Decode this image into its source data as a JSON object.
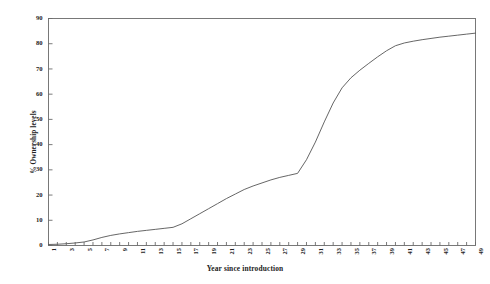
{
  "chart_data": {
    "type": "line",
    "title": "",
    "xlabel": "Year since introduction",
    "ylabel": "% Ownership levels",
    "xlim": [
      1,
      49
    ],
    "ylim": [
      0,
      90
    ],
    "grid": false,
    "legend": null,
    "line_color": "#555555",
    "y_ticks": [
      0,
      10,
      20,
      30,
      40,
      50,
      60,
      70,
      80,
      90
    ],
    "x_ticks": [
      1,
      3,
      5,
      7,
      9,
      11,
      13,
      15,
      17,
      19,
      21,
      23,
      25,
      27,
      29,
      31,
      33,
      35,
      37,
      39,
      41,
      43,
      45,
      47,
      49
    ],
    "x": [
      1,
      2,
      3,
      4,
      5,
      6,
      7,
      8,
      9,
      10,
      11,
      12,
      13,
      14,
      15,
      16,
      17,
      18,
      19,
      20,
      21,
      22,
      23,
      24,
      25,
      26,
      27,
      28,
      29,
      30,
      31,
      32,
      33,
      34,
      35,
      36,
      37,
      38,
      39,
      40,
      41,
      42,
      43,
      44,
      45,
      46,
      47,
      48,
      49
    ],
    "values": [
      0.4,
      0.5,
      0.7,
      1.0,
      1.4,
      2.2,
      3.2,
      4.0,
      4.6,
      5.1,
      5.6,
      6.0,
      6.4,
      6.8,
      7.2,
      8.6,
      10.6,
      12.6,
      14.6,
      16.6,
      18.6,
      20.4,
      22.2,
      23.6,
      24.8,
      26.0,
      27.0,
      27.8,
      28.6,
      34.0,
      41.0,
      49.0,
      56.5,
      62.5,
      66.5,
      69.5,
      72.2,
      74.8,
      77.2,
      79.2,
      80.3,
      81.0,
      81.6,
      82.1,
      82.6,
      83.0,
      83.4,
      83.8,
      84.2
    ]
  }
}
